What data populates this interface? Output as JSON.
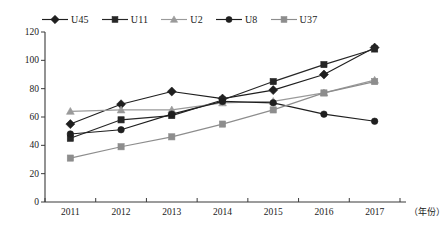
{
  "chart_data": {
    "type": "line",
    "title": "",
    "xlabel": "（年份）",
    "ylabel": "",
    "categories": [
      "2011",
      "2012",
      "2013",
      "2014",
      "2015",
      "2016",
      "2017"
    ],
    "x": [
      2011,
      2012,
      2013,
      2014,
      2015,
      2016,
      2017
    ],
    "ylim": [
      0,
      120
    ],
    "yticks": [
      0,
      20,
      40,
      60,
      80,
      100,
      120
    ],
    "ytick_labels": [
      "0",
      "20",
      "40",
      "60",
      "80",
      "100",
      "120"
    ],
    "grid": false,
    "legend_position": "top",
    "series": [
      {
        "name": "U45",
        "marker": "diamond",
        "color": "#1f1f1f",
        "values": [
          55,
          69,
          78,
          73,
          79,
          90,
          109
        ]
      },
      {
        "name": "U11",
        "marker": "square",
        "color": "#262626",
        "values": [
          45,
          58,
          61,
          72,
          85,
          97,
          108
        ]
      },
      {
        "name": "U2",
        "marker": "triangle",
        "color": "#9a9a9a",
        "values": [
          64,
          65,
          65,
          70,
          71,
          77,
          86
        ]
      },
      {
        "name": "U8",
        "marker": "circle",
        "color": "#1f1f1f",
        "values": [
          48,
          51,
          62,
          71,
          70,
          62,
          57
        ]
      },
      {
        "name": "U37",
        "marker": "square",
        "color": "#8d8d8d",
        "values": [
          31,
          39,
          46,
          55,
          65,
          77,
          85
        ]
      }
    ]
  },
  "axes": {
    "y_tick_labels": [
      "120",
      "100",
      "80",
      "60",
      "40",
      "20",
      "0"
    ],
    "x_tick_labels": [
      "2011",
      "2012",
      "2013",
      "2014",
      "2015",
      "2016",
      "2017"
    ],
    "x_unit_label": "（年份）",
    "axis_color": "#3a3a3a"
  },
  "legend": {
    "items": [
      {
        "label": "U45",
        "marker": "diamond-marker-icon",
        "color": "#1f1f1f"
      },
      {
        "label": "U11",
        "marker": "square-marker-icon",
        "color": "#262626"
      },
      {
        "label": "U2",
        "marker": "triangle-marker-icon",
        "color": "#9a9a9a"
      },
      {
        "label": "U8",
        "marker": "circle-marker-icon",
        "color": "#1f1f1f"
      },
      {
        "label": "U37",
        "marker": "square-marker-icon",
        "color": "#8d8d8d"
      }
    ]
  }
}
